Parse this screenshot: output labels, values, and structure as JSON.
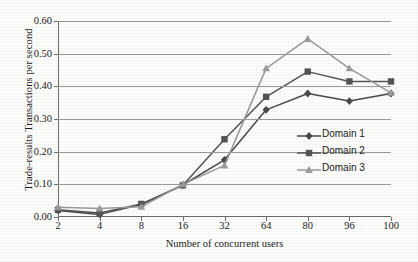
{
  "chart_data": {
    "type": "line",
    "title": "",
    "xlabel": "Number of concurrent users",
    "ylabel": "Trade-results Transactions per second",
    "categories": [
      "2",
      "4",
      "8",
      "16",
      "32",
      "64",
      "80",
      "96",
      "100"
    ],
    "ylim": [
      0.0,
      0.6
    ],
    "ytick_labels": [
      "0.00",
      "0.10",
      "0.20",
      "0.30",
      "0.40",
      "0.50",
      "0.60"
    ],
    "ytick_values": [
      0.0,
      0.1,
      0.2,
      0.3,
      0.4,
      0.5,
      0.6
    ],
    "grid": true,
    "legend_position": "right-middle",
    "series": [
      {
        "name": "Domain 1",
        "marker": "diamond",
        "color": "#4a4a4a",
        "values": [
          0.02,
          0.008,
          0.038,
          0.098,
          0.175,
          0.328,
          0.378,
          0.355,
          0.378
        ]
      },
      {
        "name": "Domain 2",
        "marker": "square",
        "color": "#555555",
        "values": [
          0.022,
          0.012,
          0.04,
          0.097,
          0.238,
          0.368,
          0.445,
          0.415,
          0.415
        ]
      },
      {
        "name": "Domain 3",
        "marker": "triangle",
        "color": "#9b9b9b",
        "values": [
          0.03,
          0.026,
          0.031,
          0.1,
          0.158,
          0.455,
          0.545,
          0.455,
          0.38
        ]
      }
    ]
  }
}
